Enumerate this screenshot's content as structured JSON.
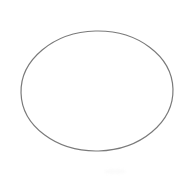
{
  "figure": {
    "canvas": {
      "width": 183,
      "height": 178,
      "background_color": "#ffffff"
    },
    "title": "",
    "caption": "",
    "shapes": [
      {
        "name": "ellipse-outline",
        "type": "ellipse",
        "center_x": 97,
        "center_y": 91,
        "radius_x": 76,
        "radius_y": 60,
        "rotation_deg": -1.5,
        "stroke_color": "#7a7a7a",
        "stroke_width": 1.2,
        "fill": "none",
        "bounds": {
          "left": 21,
          "top": 31,
          "right": 173,
          "bottom": 151
        }
      }
    ],
    "artifacts": [
      {
        "name": "scan-smudge",
        "type": "smudge",
        "x": 104,
        "y": 169,
        "width": 22,
        "height": 5,
        "color": "#fbfbfb"
      }
    ]
  }
}
